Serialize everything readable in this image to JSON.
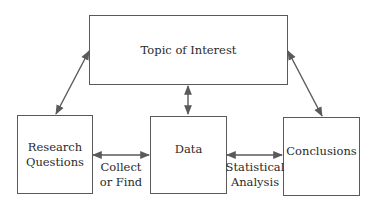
{
  "diagram": {
    "nodes": {
      "topic": "Topic of Interest",
      "research": {
        "line1": "Research",
        "line2": "Questions"
      },
      "data": "Data",
      "conclusions": "Conclusions"
    },
    "edges": {
      "collect": {
        "line1": "Collect",
        "line2": "or Find"
      },
      "stats": {
        "line1": "Statistical",
        "line2": "Analysis"
      }
    },
    "colors": {
      "line": "#5a5a5a",
      "text": "#2a2a2a"
    }
  }
}
